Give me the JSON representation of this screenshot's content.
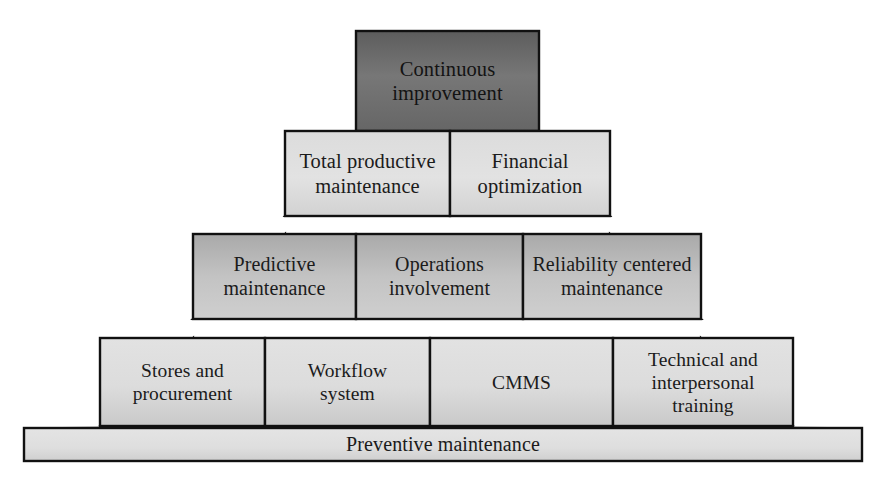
{
  "diagram": {
    "type": "pyramid",
    "background_color": "#ffffff",
    "outline_color": "#111111",
    "tiers": [
      {
        "level": 1,
        "name": "apex",
        "fill_color": "#6f6f6f",
        "blocks": [
          {
            "label": "Continuous\nimprovement"
          }
        ]
      },
      {
        "level": 2,
        "name": "tier-two",
        "fill_color": "#d9d9d9",
        "blocks": [
          {
            "label": "Total productive\nmaintenance"
          },
          {
            "label": "Financial\noptimization"
          }
        ]
      },
      {
        "level": 3,
        "name": "tier-three",
        "fill_color": "#bdbdbd",
        "blocks": [
          {
            "label": "Predictive\nmaintenance"
          },
          {
            "label": "Operations\ninvolvement"
          },
          {
            "label": "Reliability centered\nmaintenance"
          }
        ]
      },
      {
        "level": 4,
        "name": "tier-four",
        "fill_color": "#d5d5d5",
        "blocks": [
          {
            "label": "Stores and\nprocurement"
          },
          {
            "label": "Workflow\nsystem"
          },
          {
            "label": "CMMS"
          },
          {
            "label": "Technical and\ninterpersonal\ntraining"
          }
        ]
      },
      {
        "level": 5,
        "name": "foundation",
        "fill_color": "#dcdcdc",
        "blocks": [
          {
            "label": "Preventive maintenance"
          }
        ]
      }
    ],
    "wings": {
      "fill_color": "#cfcfcf",
      "description": "slanted triangular side faces of the pyramid"
    }
  }
}
